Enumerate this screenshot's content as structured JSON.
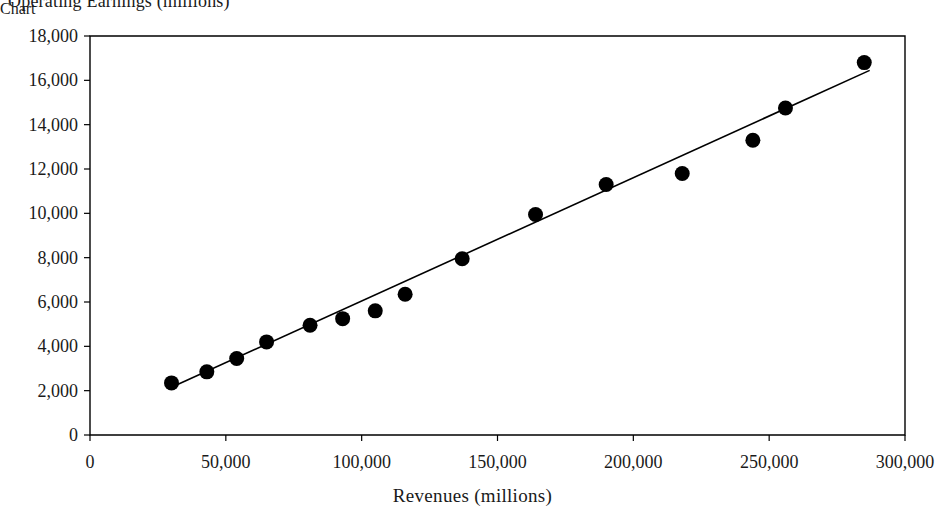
{
  "chart_data": {
    "type": "scatter",
    "title": "Operating Earnings (millions)",
    "xlabel": "Revenues (millions)",
    "ylabel": "Operating Earnings (millions)",
    "xlim": [
      0,
      300000
    ],
    "ylim": [
      0,
      18000
    ],
    "grid": false,
    "legend": "none",
    "x_ticks": [
      0,
      50000,
      100000,
      150000,
      200000,
      250000,
      300000
    ],
    "x_tick_labels": [
      "0",
      "50,000",
      "100,000",
      "150,000",
      "200,000",
      "250,000",
      "300,000"
    ],
    "y_ticks": [
      0,
      2000,
      4000,
      6000,
      8000,
      10000,
      12000,
      14000,
      16000,
      18000
    ],
    "y_tick_labels": [
      "0",
      "2,000",
      "4,000",
      "6,000",
      "8,000",
      "10,000",
      "12,000",
      "14,000",
      "16,000",
      "18,000"
    ],
    "series": [
      {
        "name": "Companies",
        "marker": "circle",
        "color": "#000000",
        "points": [
          {
            "x": 30000,
            "y": 2350
          },
          {
            "x": 43000,
            "y": 2850
          },
          {
            "x": 54000,
            "y": 3450
          },
          {
            "x": 65000,
            "y": 4200
          },
          {
            "x": 81000,
            "y": 4950
          },
          {
            "x": 93000,
            "y": 5250
          },
          {
            "x": 105000,
            "y": 5600
          },
          {
            "x": 116000,
            "y": 6350
          },
          {
            "x": 137000,
            "y": 7950
          },
          {
            "x": 164000,
            "y": 9950
          },
          {
            "x": 190000,
            "y": 11300
          },
          {
            "x": 218000,
            "y": 11800
          },
          {
            "x": 244000,
            "y": 13300
          },
          {
            "x": 256000,
            "y": 14750
          },
          {
            "x": 285000,
            "y": 16800
          }
        ]
      }
    ],
    "trendline": {
      "name": "linear-fit",
      "color": "#000000",
      "x_start": 30000,
      "y_start": 2150,
      "x_end": 287000,
      "y_end": 16450
    },
    "colors": {
      "marker": "#000000",
      "trendline": "#000000",
      "axis": "#000000",
      "text": "#1a1a1a",
      "background": "#ffffff"
    }
  },
  "layout": {
    "plot_left": 90,
    "plot_right": 905,
    "plot_top": 36,
    "plot_bottom": 435
  }
}
